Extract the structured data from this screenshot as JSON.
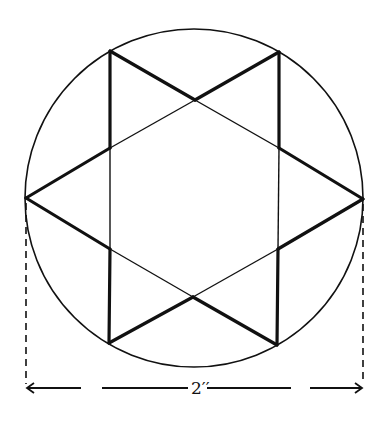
{
  "diagram": {
    "dimension_label": "2′′",
    "colors": {
      "stroke": "#111111",
      "background": "#ffffff"
    },
    "circle": {
      "cx": 194,
      "cy": 198,
      "r": 169
    },
    "vertices": {
      "top_left": [
        110,
        51
      ],
      "top_right": [
        279,
        52
      ],
      "left": [
        26,
        198
      ],
      "right": [
        363,
        199
      ],
      "bottom_left": [
        109,
        343
      ],
      "bottom_right": [
        277,
        345
      ]
    },
    "dimension": {
      "y": 388,
      "x_start": 26,
      "x_end": 363,
      "meaning": "diameter of circle"
    }
  }
}
